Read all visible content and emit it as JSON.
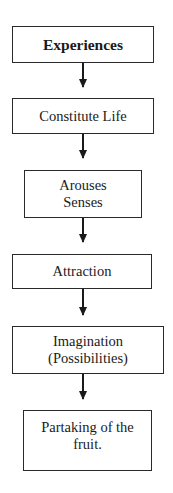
{
  "diagram": {
    "type": "vertical-flowchart",
    "nodes": [
      {
        "id": "experiences",
        "label": "Experiences",
        "bold": true
      },
      {
        "id": "constitute-life",
        "label": "Constitute Life",
        "bold": false
      },
      {
        "id": "arouses-senses",
        "label": "Arouses Senses",
        "bold": false
      },
      {
        "id": "attraction",
        "label": "Attraction",
        "bold": false
      },
      {
        "id": "imagination",
        "label": "Imagination (Possibilities)",
        "bold": false
      },
      {
        "id": "partaking",
        "label": "Partaking of the fruit.",
        "bold": false
      }
    ],
    "edges": [
      {
        "from": "experiences",
        "to": "constitute-life"
      },
      {
        "from": "constitute-life",
        "to": "arouses-senses"
      },
      {
        "from": "arouses-senses",
        "to": "attraction"
      },
      {
        "from": "attraction",
        "to": "imagination"
      },
      {
        "from": "imagination",
        "to": "partaking"
      }
    ]
  }
}
